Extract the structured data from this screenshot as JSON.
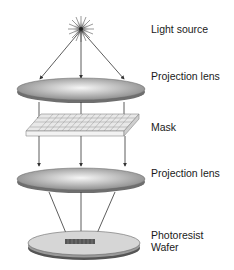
{
  "diagram": {
    "type": "photolithography-projection-system",
    "labels": {
      "light_source": "Light source",
      "projection_lens_top": "Projection lens",
      "mask": "Mask",
      "projection_lens_bottom": "Projection lens",
      "photoresist": "Photoresist",
      "wafer": "Wafer"
    },
    "colors": {
      "lens_fill": "#9a9a9a",
      "lens_highlight": "#f2f2f2",
      "mask_top": "#e6e6e6",
      "mask_grid": "#8a8a8a",
      "wafer_fill": "#d4d4d4",
      "wafer_edge": "#555555",
      "arrow": "#333333"
    }
  }
}
